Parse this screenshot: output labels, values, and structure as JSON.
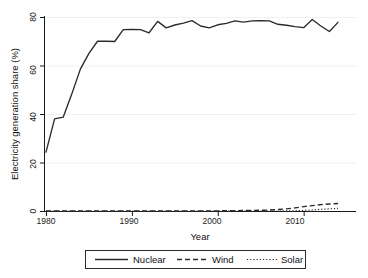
{
  "chart_data": {
    "type": "line",
    "title": "",
    "subtitle": "",
    "xlabel": "Year",
    "ylabel": "Electricity generation share (%)",
    "xlim": [
      1979,
      2015
    ],
    "ylim": [
      0,
      82
    ],
    "xticks": [
      1980,
      1990,
      2000,
      2010
    ],
    "xtick_labels": [
      "1980",
      "1990",
      "2000",
      "2010"
    ],
    "yticks": [
      0,
      20,
      40,
      60,
      80
    ],
    "ytick_labels": [
      "0",
      "20",
      "40",
      "60",
      "80"
    ],
    "grid": "horizontal",
    "legend_position": "bottom-outside",
    "x": [
      1980,
      1981,
      1982,
      1983,
      1984,
      1985,
      1986,
      1987,
      1988,
      1989,
      1990,
      1991,
      1992,
      1993,
      1994,
      1995,
      1996,
      1997,
      1998,
      1999,
      2000,
      2001,
      2002,
      2003,
      2004,
      2005,
      2006,
      2007,
      2008,
      2009,
      2010,
      2011,
      2012,
      2013,
      2014
    ],
    "series": [
      {
        "name": "Nuclear",
        "style": "solid",
        "color": "#2b2b2b",
        "values": [
          24.3,
          38.0,
          38.7,
          48.2,
          58.5,
          65.0,
          70.0,
          70.0,
          69.9,
          74.8,
          74.9,
          74.8,
          73.5,
          78.2,
          75.5,
          76.7,
          77.5,
          78.5,
          76.3,
          75.5,
          76.8,
          77.4,
          78.4,
          77.9,
          78.4,
          78.5,
          78.4,
          77.0,
          76.6,
          76.0,
          75.6,
          79.0,
          76.3,
          74.0,
          77.8
        ]
      },
      {
        "name": "Wind",
        "style": "dashed",
        "color": "#2b2b2b",
        "values": [
          0.0,
          0.0,
          0.0,
          0.0,
          0.0,
          0.0,
          0.0,
          0.0,
          0.0,
          0.0,
          0.0,
          0.0,
          0.0,
          0.0,
          0.0,
          0.0,
          0.0,
          0.0,
          0.0,
          0.05,
          0.07,
          0.1,
          0.15,
          0.2,
          0.25,
          0.3,
          0.4,
          0.6,
          0.9,
          1.3,
          1.8,
          2.2,
          2.6,
          2.9,
          3.1
        ]
      },
      {
        "name": "Solar",
        "style": "dotted",
        "color": "#2b2b2b",
        "values": [
          0.0,
          0.0,
          0.0,
          0.0,
          0.0,
          0.0,
          0.0,
          0.0,
          0.0,
          0.0,
          0.0,
          0.0,
          0.0,
          0.0,
          0.0,
          0.0,
          0.0,
          0.0,
          0.0,
          0.0,
          0.0,
          0.0,
          0.0,
          0.0,
          0.0,
          0.0,
          0.0,
          0.0,
          0.05,
          0.1,
          0.2,
          0.4,
          0.7,
          0.9,
          1.1
        ]
      }
    ]
  },
  "axes": {
    "ylabel": "Electricity generation share (%)",
    "xlabel": "Year",
    "ytick_0": "0",
    "ytick_20": "20",
    "ytick_40": "40",
    "ytick_60": "60",
    "ytick_80": "80",
    "xtick_1980": "1980",
    "xtick_1990": "1990",
    "xtick_2000": "2000",
    "xtick_2010": "2010"
  },
  "legend": {
    "entries": [
      {
        "label": "Nuclear",
        "style": "solid"
      },
      {
        "label": "Wind",
        "style": "dashed"
      },
      {
        "label": "Solar",
        "style": "dotted"
      }
    ],
    "nuclear_label": "Nuclear",
    "wind_label": "Wind",
    "solar_label": "Solar"
  },
  "colors": {
    "ink": "#2b2b2b",
    "grid": "#ececec",
    "background": "#ffffff"
  }
}
